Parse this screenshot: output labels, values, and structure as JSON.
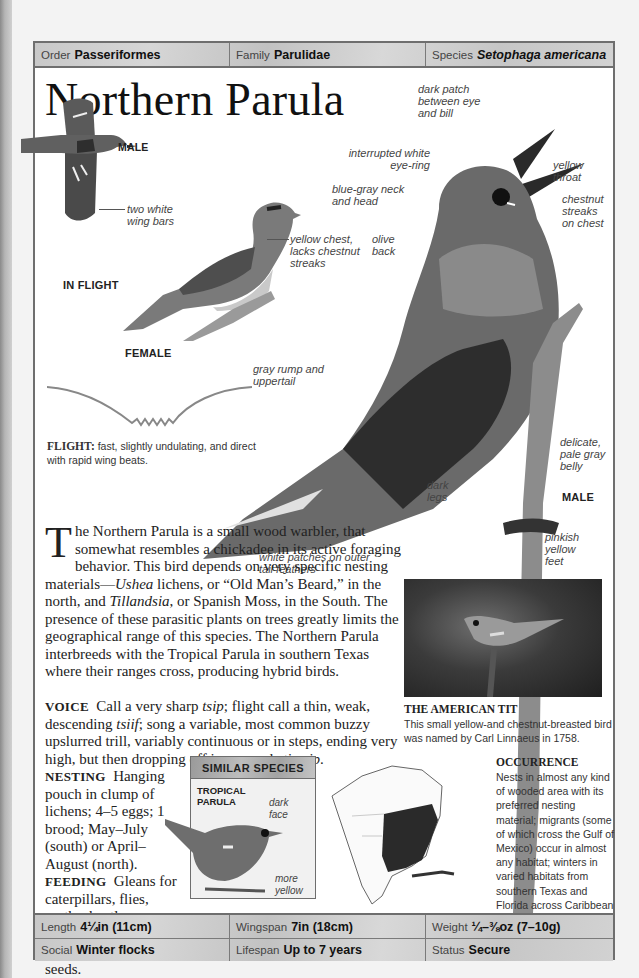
{
  "taxonomy": {
    "order": {
      "label": "Order",
      "value": "Passeriformes"
    },
    "family": {
      "label": "Family",
      "value": "Parulidae"
    },
    "species": {
      "label": "Species",
      "value": "Setophaga americana"
    }
  },
  "title": "Northern Parula",
  "illustrations": {
    "in_flight": {
      "sex_label": "MALE",
      "caption": "IN FLIGHT",
      "annotations": [
        "two white wing bars"
      ]
    },
    "female": {
      "caption": "FEMALE",
      "annotations": [
        "yellow chest, lacks chestnut streaks"
      ]
    },
    "male": {
      "caption": "MALE",
      "annotations": [
        "dark patch between eye and bill",
        "interrupted white eye-ring",
        "yellow throat",
        "blue-gray neck and head",
        "chestnut streaks on chest",
        "olive back",
        "gray rump and uppertail",
        "delicate, pale gray belly",
        "dark legs",
        "pinkish yellow feet",
        "white patches on outer tail feathers"
      ]
    }
  },
  "flight": {
    "label": "FLIGHT:",
    "text": "fast, slightly undulating, and direct with rapid wing beats."
  },
  "description": {
    "dropcap": "T",
    "intro": "he Northern Parula is a small wood warbler, that somewhat resembles a chickadee in its active foraging behavior. This bird depends on very specific nesting materials—",
    "ushea": "Ushea",
    "mid1": " lichens, or “Old Man’s Beard,” in the north, and ",
    "tillandsia": "Tillandsia",
    "rest": ", or Spanish Moss, in the South. The presence of these parasitic plants on trees greatly limits the geographical range of this species. The Northern Parula interbreeds with the Tropical Parula in southern Texas where their ranges cross, producing hybrid birds."
  },
  "voice": {
    "label": "VOICE",
    "t1": "Call a very sharp ",
    "tsip": "tsip",
    "t2": "; flight call a thin, weak, descending ",
    "tsiif": "tsiif",
    "t3": "; song a variable, most common buzzy upslurred trill, variably continuous or in steps, ending very high, but then dropping off in an emphatic ",
    "zip": "zip",
    "t4": "."
  },
  "nesting": {
    "label": "NESTING",
    "text": "Hanging pouch in clump of lichens; 4–5 eggs; 1 brood; May–July (south) or April–August (north)."
  },
  "feeding": {
    "label": "FEEDING",
    "text": "Gleans for caterpillars, flies, moths, beetles, wasps, ants, spiders; also eats berries, nectar, some seeds."
  },
  "photo": {
    "title": "THE AMERICAN TIT",
    "caption": "This small yellow-and chestnut-breasted bird was named by Carl Linnaeus in 1758."
  },
  "similar_species": {
    "heading": "SIMILAR SPECIES",
    "name_line1": "TROPICAL",
    "name_line2": "PARULA",
    "annotations": [
      "dark face",
      "more yellow"
    ]
  },
  "occurrence": {
    "title": "OCCURRENCE",
    "text": "Nests in almost any kind of wooded area with its preferred nesting material; migrants (some of which cross the Gulf of Mexico) occur in almost any habitat; winters in varied habitats from southern Texas and Florida across Caribbean and Mexico south to Panama."
  },
  "stats": {
    "length": {
      "label": "Length",
      "value": "4¼in (11cm)"
    },
    "wingspan": {
      "label": "Wingspan",
      "value": "7in (18cm)"
    },
    "weight": {
      "label": "Weight",
      "value": "¼–⅜oz (7–10g)"
    },
    "social": {
      "label": "Social",
      "value": "Winter flocks"
    },
    "lifespan": {
      "label": "Lifespan",
      "value": "Up to 7 years"
    },
    "status": {
      "label": "Status",
      "value": "Secure"
    }
  }
}
